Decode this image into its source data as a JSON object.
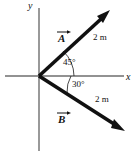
{
  "figure": {
    "type": "physics-vector-diagram",
    "background_color": "#ffffff",
    "stroke_color": "#111111",
    "axis_color": "#6b6b6b",
    "width": 136,
    "height": 154,
    "origin": {
      "x": 39,
      "y": 76
    }
  },
  "axes": {
    "x_label": "x",
    "y_label": "y",
    "x_start": {
      "x": 5,
      "y": 76
    },
    "x_end": {
      "x": 124,
      "y": 76
    },
    "y_start": {
      "x": 39,
      "y": 8
    },
    "y_end": {
      "x": 39,
      "y": 151
    }
  },
  "vectors": [
    {
      "name": "A",
      "label": "A",
      "magnitude_label": "2 m",
      "angle_label": "45°",
      "angle_degrees": 45,
      "direction": "above-positive-x-axis",
      "tail": {
        "x": 39,
        "y": 76
      },
      "tip": {
        "x": 110,
        "y": 10
      }
    },
    {
      "name": "B",
      "label": "B",
      "magnitude_label": "2 m",
      "angle_label": "30°",
      "angle_degrees": 30,
      "direction": "below-positive-x-axis",
      "tail": {
        "x": 39,
        "y": 76
      },
      "tip": {
        "x": 125,
        "y": 131
      }
    }
  ],
  "labels": {
    "vector_a": "A",
    "vector_b": "B",
    "magnitude_a": "2 m",
    "magnitude_b": "2 m",
    "angle_a": "45°",
    "angle_b": "30°",
    "axis_x": "x",
    "axis_y": "y"
  }
}
